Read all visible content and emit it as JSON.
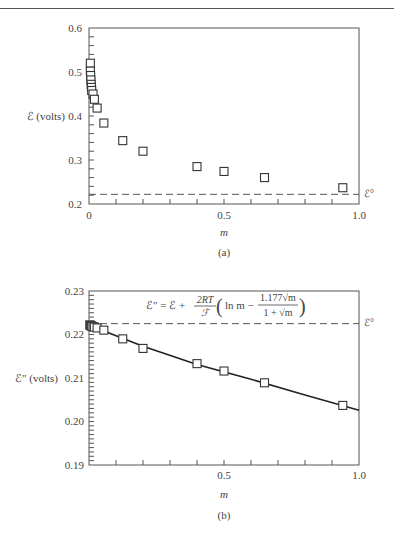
{
  "chart_data": [
    {
      "type": "scatter",
      "panel_label": "(a)",
      "title": "",
      "xlabel": "m",
      "ylabel": "ℰ (volts)",
      "xlim": [
        0,
        1.0
      ],
      "ylim": [
        0.2,
        0.6
      ],
      "x_tick_labels": [
        "0",
        "0.5",
        "1.0"
      ],
      "y_tick_labels": [
        "0.2",
        "0.3",
        "0.4",
        "0.5",
        "0.6"
      ],
      "grid": false,
      "marker": "open-square",
      "reference_line": {
        "label": "ℰ°",
        "y": 0.222,
        "style": "dashed"
      },
      "series": [
        {
          "name": "measured ℰ",
          "x": [
            0.005,
            0.005,
            0.006,
            0.007,
            0.008,
            0.009,
            0.01,
            0.015,
            0.02,
            0.03,
            0.055,
            0.125,
            0.2,
            0.4,
            0.5,
            0.65,
            0.94
          ],
          "y": [
            0.52,
            0.502,
            0.492,
            0.482,
            0.472,
            0.465,
            0.458,
            0.45,
            0.438,
            0.418,
            0.384,
            0.344,
            0.32,
            0.285,
            0.274,
            0.26,
            0.237
          ]
        }
      ]
    },
    {
      "type": "scatter",
      "panel_label": "(b)",
      "title": "",
      "xlabel": "m",
      "ylabel": "ℰ\" (volts)",
      "xlim": [
        0,
        1.0
      ],
      "ylim": [
        0.19,
        0.23
      ],
      "x_tick_labels": [
        "0.5",
        "1.0"
      ],
      "y_tick_labels": [
        "0.19",
        "0.20",
        "0.21",
        "0.22",
        "0.23"
      ],
      "grid": false,
      "marker": "open-square",
      "annotation": "ℰ\" = ℰ + (2RT/ℱ)(ln m − 1.177√m / (1 + √m))",
      "reference_line": {
        "label": "ℰ°",
        "y": 0.2225,
        "style": "dashed"
      },
      "series": [
        {
          "name": "ℰ\" points",
          "x": [
            0.003,
            0.005,
            0.008,
            0.01,
            0.015,
            0.02,
            0.03,
            0.055,
            0.125,
            0.2,
            0.4,
            0.5,
            0.65,
            0.94
          ],
          "y": [
            0.2222,
            0.2221,
            0.222,
            0.2219,
            0.2218,
            0.2217,
            0.2215,
            0.221,
            0.219,
            0.2168,
            0.2133,
            0.2116,
            0.2089,
            0.2037
          ]
        },
        {
          "name": "fitted line",
          "x": [
            0.0,
            0.1,
            0.2,
            0.4,
            0.6,
            0.8,
            1.0
          ],
          "y": [
            0.2222,
            0.2197,
            0.2173,
            0.2131,
            0.2097,
            0.2061,
            0.2026
          ]
        }
      ]
    }
  ],
  "panels": {
    "a": {
      "ylabel": "ℰ (volts)",
      "xlabel": "m",
      "caption": "(a)",
      "ref_label": "ℰ°",
      "xticks": [
        "0",
        "0.5",
        "1.0"
      ],
      "yticks": [
        "0.2",
        "0.3",
        "0.4",
        "0.5",
        "0.6"
      ]
    },
    "b": {
      "ylabel": "ℰ\" (volts)",
      "xlabel": "m",
      "caption": "(b)",
      "ref_label": "ℰ°",
      "xticks": [
        "0.5",
        "1.0"
      ],
      "yticks": [
        "0.19",
        "0.20",
        "0.21",
        "0.22",
        "0.23"
      ],
      "eq_lhs": "ℰ\" = ℰ +",
      "eq_frac_num": "2RT",
      "eq_frac_den": "ℱ",
      "eq_ln": "ln m −",
      "eq_inner_num": "1.177√m",
      "eq_inner_den": "1 + √m"
    }
  }
}
